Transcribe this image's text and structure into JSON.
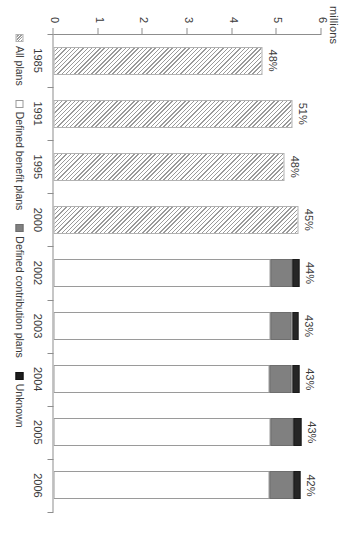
{
  "chart": {
    "axis_caption": "millions",
    "value_ticks": [
      "0",
      "1",
      "2",
      "3",
      "4",
      "5",
      "6"
    ],
    "categories": [
      "1985",
      "1991",
      "1995",
      "2000",
      "2002",
      "2003",
      "2004",
      "2005",
      "2006"
    ],
    "pct_labels": [
      "48%",
      "51%",
      "48%",
      "45%",
      "44%",
      "43%",
      "43%",
      "43%",
      "42%"
    ]
  },
  "legend": {
    "items": [
      {
        "label": "All plans",
        "key": "all",
        "color": "#9a9a9a"
      },
      {
        "label": "Defined benefit plans",
        "key": "db",
        "color": "#ffffff"
      },
      {
        "label": "Defined contribution plans",
        "key": "dc",
        "color": "#808080"
      },
      {
        "label": "Unknown",
        "key": "unk",
        "color": "#1d1d1d"
      }
    ]
  },
  "chart_data": {
    "type": "bar",
    "orientation": "horizontal",
    "stacked": true,
    "title": "",
    "subtitle": "",
    "xlabel": "",
    "ylabel": "millions",
    "ylim": [
      0,
      6
    ],
    "yticks": [
      0,
      1,
      2,
      3,
      4,
      5,
      6
    ],
    "grid": false,
    "legend_position": "bottom",
    "categories": [
      "1985",
      "1991",
      "1995",
      "2000",
      "2002",
      "2003",
      "2004",
      "2005",
      "2006"
    ],
    "data_labels": [
      "48%",
      "51%",
      "48%",
      "45%",
      "44%",
      "43%",
      "43%",
      "43%",
      "42%"
    ],
    "series": [
      {
        "name": "All plans",
        "values": [
          4.67,
          5.35,
          5.17,
          5.48,
          null,
          null,
          null,
          null,
          null
        ]
      },
      {
        "name": "Defined benefit plans",
        "values": [
          null,
          null,
          null,
          null,
          4.85,
          4.85,
          4.83,
          4.86,
          4.84
        ]
      },
      {
        "name": "Defined contribution plans",
        "values": [
          null,
          null,
          null,
          null,
          0.5,
          0.49,
          0.51,
          0.52,
          0.53
        ]
      },
      {
        "name": "Unknown",
        "values": [
          null,
          null,
          null,
          null,
          0.16,
          0.15,
          0.16,
          0.17,
          0.16
        ]
      }
    ],
    "totals": [
      4.67,
      5.35,
      5.17,
      5.48,
      5.51,
      5.49,
      5.5,
      5.55,
      5.53
    ]
  }
}
